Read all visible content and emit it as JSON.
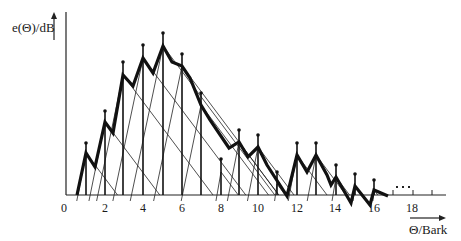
{
  "diagram": {
    "y_axis_label": "e(Θ)/dB",
    "x_axis_label": "Θ/Bark",
    "x_ticks": [
      {
        "label": "0",
        "x": 64
      },
      {
        "label": "2",
        "x": 105
      },
      {
        "label": "4",
        "x": 143
      },
      {
        "label": "6",
        "x": 182
      },
      {
        "label": "8",
        "x": 221
      },
      {
        "label": "10",
        "x": 258
      },
      {
        "label": "12",
        "x": 297
      },
      {
        "label": "14",
        "x": 335
      },
      {
        "label": "16",
        "x": 374
      },
      {
        "label": "18",
        "x": 412
      }
    ],
    "ellipsis": "...",
    "tones": [
      {
        "bark": 1,
        "x": 86,
        "dot_y": 143,
        "peak_y": 153
      },
      {
        "bark": 2,
        "x": 105,
        "dot_y": 111,
        "peak_y": 122
      },
      {
        "bark": 3,
        "x": 123,
        "dot_y": 62,
        "peak_y": 75
      },
      {
        "bark": 4,
        "x": 143,
        "dot_y": 45,
        "peak_y": 58
      },
      {
        "bark": 5,
        "x": 163,
        "dot_y": 33,
        "peak_y": 46
      },
      {
        "bark": 6,
        "x": 182,
        "dot_y": 54,
        "peak_y": 66
      },
      {
        "bark": 7,
        "x": 201,
        "dot_y": 93,
        "peak_y": 105
      },
      {
        "bark": 8,
        "x": 221,
        "dot_y": 159,
        "peak_y": 172
      },
      {
        "bark": 9,
        "x": 239,
        "dot_y": 130,
        "peak_y": 142
      },
      {
        "bark": 10,
        "x": 258,
        "dot_y": 135,
        "peak_y": 147
      },
      {
        "bark": 11,
        "x": 277,
        "dot_y": 172,
        "peak_y": 184
      },
      {
        "bark": 12,
        "x": 297,
        "dot_y": 143,
        "peak_y": 155
      },
      {
        "bark": 13,
        "x": 316,
        "dot_y": 143,
        "peak_y": 155
      },
      {
        "bark": 14,
        "x": 336,
        "dot_y": 165,
        "peak_y": 177
      },
      {
        "bark": 15,
        "x": 355,
        "dot_y": 174,
        "peak_y": 186
      },
      {
        "bark": 16,
        "x": 374,
        "dot_y": 180,
        "peak_y": 190
      }
    ],
    "envelope_points": "77,195 86,153 95,167 105,122 113,133 123,75 133,86 143,58 153,73 163,46 172,62 182,66 190,78 201,105 210,120 229,148 239,142 248,157 258,147 267,165 287,196 297,155 307,172 316,155 327,175 331,185 336,177 351,203 355,186 370,205 374,190 388,196"
  }
}
